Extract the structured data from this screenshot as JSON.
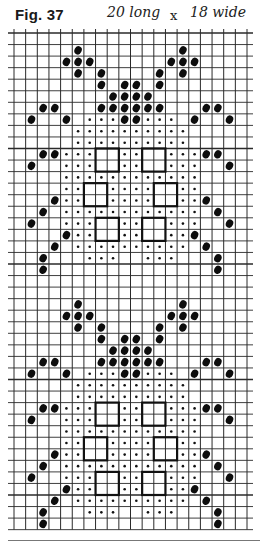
{
  "figure": {
    "title": "Fig. 37",
    "note_length": "20 long",
    "note_x": "x",
    "note_width": "18 wide"
  },
  "chart_data": {
    "type": "grid-pattern",
    "title": "Fig. 37",
    "annotation": "20 long x 18 wide",
    "columns": 20,
    "rows": 43,
    "grid": {
      "left": 14,
      "top": 33,
      "cell_w": 11.65,
      "cell_h": 11.55,
      "line_color": "#2a2a2a"
    },
    "legend": {
      "big_dot": "filled oval",
      "small_dot": "small dot",
      "square": "outlined 2x2 block"
    },
    "motif_row_offsets": [
      0,
      22
    ],
    "motif": {
      "big": [
        [
          1,
          5
        ],
        [
          1,
          14
        ],
        [
          2,
          4
        ],
        [
          2,
          5
        ],
        [
          2,
          6
        ],
        [
          2,
          13
        ],
        [
          2,
          14
        ],
        [
          2,
          15
        ],
        [
          3,
          5
        ],
        [
          3,
          7
        ],
        [
          3,
          12
        ],
        [
          3,
          14
        ],
        [
          4,
          7
        ],
        [
          4,
          9
        ],
        [
          4,
          10
        ],
        [
          4,
          12
        ],
        [
          5,
          8
        ],
        [
          5,
          9
        ],
        [
          5,
          10
        ],
        [
          5,
          11
        ],
        [
          6,
          2
        ],
        [
          6,
          3
        ],
        [
          6,
          7
        ],
        [
          6,
          8
        ],
        [
          6,
          9
        ],
        [
          6,
          10
        ],
        [
          6,
          11
        ],
        [
          6,
          12
        ],
        [
          6,
          16
        ],
        [
          6,
          17
        ],
        [
          7,
          1
        ],
        [
          7,
          4
        ],
        [
          7,
          9
        ],
        [
          7,
          10
        ],
        [
          7,
          15
        ],
        [
          7,
          18
        ],
        [
          10,
          2
        ],
        [
          10,
          3
        ],
        [
          10,
          16
        ],
        [
          10,
          17
        ],
        [
          11,
          1
        ],
        [
          11,
          18
        ],
        [
          14,
          3
        ],
        [
          14,
          16
        ],
        [
          15,
          2
        ],
        [
          15,
          17
        ],
        [
          16,
          1
        ],
        [
          16,
          18
        ],
        [
          17,
          4
        ],
        [
          17,
          15
        ],
        [
          18,
          3
        ],
        [
          18,
          16
        ],
        [
          19,
          2
        ],
        [
          19,
          17
        ],
        [
          20,
          2
        ],
        [
          20,
          17
        ]
      ],
      "small": [
        [
          7,
          6
        ],
        [
          7,
          7
        ],
        [
          7,
          8
        ],
        [
          7,
          11
        ],
        [
          7,
          12
        ],
        [
          7,
          13
        ],
        [
          8,
          5
        ],
        [
          8,
          6
        ],
        [
          8,
          7
        ],
        [
          8,
          8
        ],
        [
          8,
          9
        ],
        [
          8,
          10
        ],
        [
          8,
          11
        ],
        [
          8,
          12
        ],
        [
          8,
          13
        ],
        [
          8,
          14
        ],
        [
          9,
          5
        ],
        [
          9,
          6
        ],
        [
          9,
          7
        ],
        [
          9,
          8
        ],
        [
          9,
          9
        ],
        [
          9,
          10
        ],
        [
          9,
          11
        ],
        [
          9,
          12
        ],
        [
          9,
          13
        ],
        [
          9,
          14
        ],
        [
          10,
          4
        ],
        [
          10,
          5
        ],
        [
          10,
          6
        ],
        [
          10,
          9
        ],
        [
          10,
          10
        ],
        [
          10,
          13
        ],
        [
          10,
          14
        ],
        [
          10,
          15
        ],
        [
          11,
          4
        ],
        [
          11,
          5
        ],
        [
          11,
          6
        ],
        [
          11,
          9
        ],
        [
          11,
          10
        ],
        [
          11,
          13
        ],
        [
          11,
          14
        ],
        [
          11,
          15
        ],
        [
          12,
          4
        ],
        [
          12,
          5
        ],
        [
          12,
          6
        ],
        [
          12,
          7
        ],
        [
          12,
          8
        ],
        [
          12,
          9
        ],
        [
          12,
          10
        ],
        [
          12,
          11
        ],
        [
          12,
          12
        ],
        [
          12,
          13
        ],
        [
          12,
          14
        ],
        [
          12,
          15
        ],
        [
          13,
          4
        ],
        [
          13,
          5
        ],
        [
          13,
          8
        ],
        [
          13,
          9
        ],
        [
          13,
          10
        ],
        [
          13,
          11
        ],
        [
          13,
          14
        ],
        [
          13,
          15
        ],
        [
          14,
          4
        ],
        [
          14,
          5
        ],
        [
          14,
          8
        ],
        [
          14,
          9
        ],
        [
          14,
          10
        ],
        [
          14,
          11
        ],
        [
          14,
          14
        ],
        [
          14,
          15
        ],
        [
          15,
          4
        ],
        [
          15,
          5
        ],
        [
          15,
          6
        ],
        [
          15,
          7
        ],
        [
          15,
          8
        ],
        [
          15,
          9
        ],
        [
          15,
          10
        ],
        [
          15,
          11
        ],
        [
          15,
          12
        ],
        [
          15,
          13
        ],
        [
          15,
          14
        ],
        [
          15,
          15
        ],
        [
          16,
          4
        ],
        [
          16,
          5
        ],
        [
          16,
          6
        ],
        [
          16,
          9
        ],
        [
          16,
          10
        ],
        [
          16,
          13
        ],
        [
          16,
          14
        ],
        [
          16,
          15
        ],
        [
          17,
          5
        ],
        [
          17,
          6
        ],
        [
          17,
          9
        ],
        [
          17,
          10
        ],
        [
          17,
          13
        ],
        [
          17,
          14
        ],
        [
          18,
          5
        ],
        [
          18,
          6
        ],
        [
          18,
          7
        ],
        [
          18,
          8
        ],
        [
          18,
          9
        ],
        [
          18,
          10
        ],
        [
          18,
          11
        ],
        [
          18,
          12
        ],
        [
          18,
          13
        ],
        [
          18,
          14
        ],
        [
          19,
          6
        ],
        [
          19,
          7
        ],
        [
          19,
          8
        ],
        [
          19,
          11
        ],
        [
          19,
          12
        ],
        [
          19,
          13
        ]
      ],
      "squares": [
        [
          10,
          7
        ],
        [
          10,
          11
        ],
        [
          13,
          6
        ],
        [
          13,
          12
        ],
        [
          16,
          7
        ],
        [
          16,
          11
        ]
      ]
    }
  }
}
